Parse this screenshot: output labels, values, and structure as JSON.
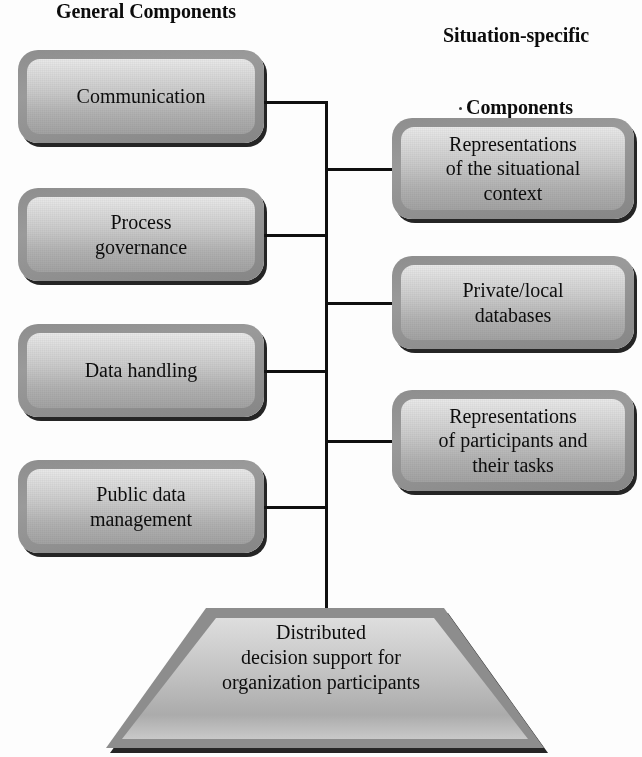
{
  "headings": {
    "left": "General Components",
    "right_line1": "Situation-specific",
    "right_line2": "Components"
  },
  "general_components": [
    {
      "label": "Communication"
    },
    {
      "label": "Process\ngovernance"
    },
    {
      "label": "Data handling"
    },
    {
      "label": "Public data\nmanagement"
    }
  ],
  "situation_specific_components": [
    {
      "label": "Representations\nof the situational\ncontext"
    },
    {
      "label": "Private/local\ndatabases"
    },
    {
      "label": "Representations\nof participants and\ntheir tasks"
    }
  ],
  "base": {
    "label": "Distributed\ndecision support for\norganization participants"
  },
  "colors": {
    "line": "#101010",
    "box_border": "#8e8e8e",
    "box_fill_top": "#e9e9e9",
    "box_fill_bottom": "#a2a2a2",
    "text": "#0d0d0d",
    "background": "#ffffff"
  }
}
